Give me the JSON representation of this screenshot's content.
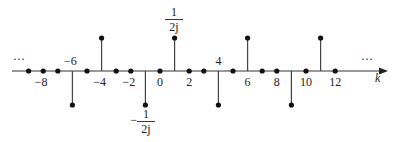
{
  "diagram": {
    "type": "stem",
    "axis_label": "k",
    "left_ellipsis": "···",
    "right_ellipsis": "···",
    "tick_labels": [
      "-8",
      "-6",
      "-4",
      "-2",
      "0",
      "2",
      "4",
      "6",
      "8",
      "10",
      "12"
    ],
    "positive_value_label": {
      "numerator": "1",
      "denominator": "2j"
    },
    "negative_value_label": {
      "sign": "−",
      "numerator": "1",
      "denominator": "2j"
    }
  },
  "chart_data": {
    "type": "stem",
    "xlabel": "k",
    "x": [
      -9,
      -8,
      -7,
      -6,
      -5,
      -4,
      -3,
      -2,
      -1,
      0,
      1,
      2,
      3,
      4,
      5,
      6,
      7,
      8,
      9,
      10,
      11,
      12
    ],
    "values": [
      "0",
      "0",
      "0",
      "-1/(2j)",
      "0",
      "1/(2j)",
      "0",
      "0",
      "-1/(2j)",
      "0",
      "1/(2j)",
      "0",
      "0",
      "-1/(2j)",
      "0",
      "1/(2j)",
      "0",
      "0",
      "-1/(2j)",
      "0",
      "1/(2j)",
      "0"
    ],
    "tick_labels": [
      -8,
      -6,
      -4,
      -2,
      0,
      2,
      4,
      6,
      8,
      10,
      12
    ],
    "annotations": [
      "1/(2j)",
      "-1/(2j)",
      "···",
      "···"
    ],
    "period": 5
  }
}
